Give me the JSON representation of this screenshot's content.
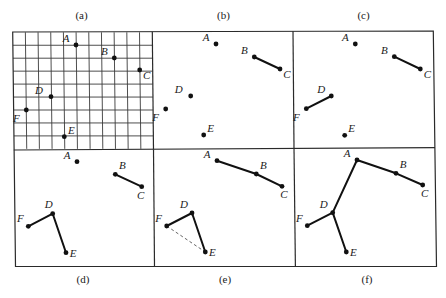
{
  "figure": {
    "description": "Six-panel figure showing step-by-step construction of a minimum spanning tree over points A-F",
    "frame": {
      "outer": [
        [
          12.7,
          32
        ],
        [
          433.3,
          31
        ],
        [
          436.5,
          266.3
        ],
        [
          15.5,
          266.5
        ]
      ],
      "middle_divider": [
        [
          13.8,
          150
        ],
        [
          435,
          147.6
        ]
      ],
      "top_dividers": [
        [
          [
            152.3,
            31.8
          ],
          [
            153.5,
            149.5
          ]
        ],
        [
          [
            293,
            31.2
          ],
          [
            294,
            148
          ]
        ]
      ],
      "bottom_dividers": [
        [
          [
            153.5,
            149.5
          ],
          [
            154.5,
            266.4
          ]
        ],
        [
          [
            294,
            148
          ],
          [
            295.4,
            266.3
          ]
        ]
      ]
    },
    "grid": {
      "panel": "a",
      "x0": 12.7,
      "y0": 32.3,
      "dx": 12.68,
      "dy": 12.95,
      "cols": 11,
      "rows": 9,
      "skew_x_per_y": 0.0115
    },
    "panels": [
      {
        "id": "a",
        "label": "(a)",
        "label_pos": [
          81.5,
          19
        ],
        "points": {
          "A": [
            76,
            45
          ],
          "B": [
            114.3,
            58
          ],
          "C": [
            139.7,
            70
          ],
          "D": [
            51,
            96.7
          ],
          "E": [
            64.3,
            136.7
          ],
          "F": [
            26.3,
            110
          ]
        },
        "label_offsets": {
          "A": [
            -10,
            -3
          ],
          "B": [
            -10,
            -3
          ],
          "C": [
            7,
            9
          ],
          "D": [
            -12,
            -3
          ],
          "E": [
            7,
            -3
          ],
          "F": [
            -10,
            12
          ]
        },
        "edges": [],
        "dashed_edges": []
      },
      {
        "id": "b",
        "label": "(b)",
        "label_pos": [
          223.5,
          19
        ],
        "points": {
          "A": [
            216,
            44
          ],
          "B": [
            254.3,
            57
          ],
          "C": [
            280,
            69
          ],
          "D": [
            190.7,
            96
          ],
          "E": [
            203.7,
            135
          ],
          "F": [
            165.7,
            109
          ]
        },
        "label_offsets": {
          "A": [
            -10,
            -3
          ],
          "B": [
            -10,
            -3
          ],
          "C": [
            7,
            9
          ],
          "D": [
            -12,
            -3
          ],
          "E": [
            7,
            -3
          ],
          "F": [
            -10,
            12
          ]
        },
        "edges": [
          [
            "B",
            "C"
          ]
        ],
        "dashed_edges": []
      },
      {
        "id": "c",
        "label": "(c)",
        "label_pos": [
          363.5,
          19
        ],
        "points": {
          "A": [
            355.3,
            44
          ],
          "B": [
            394.3,
            56.7
          ],
          "C": [
            420.3,
            69
          ],
          "D": [
            331.3,
            96
          ],
          "E": [
            344.7,
            135.3
          ],
          "F": [
            306.3,
            108.7
          ]
        },
        "label_offsets": {
          "A": [
            -10,
            -3
          ],
          "B": [
            -10,
            -3
          ],
          "C": [
            7,
            9
          ],
          "D": [
            -10,
            -3
          ],
          "E": [
            7,
            -3
          ],
          "F": [
            -10,
            12
          ]
        },
        "edges": [
          [
            "B",
            "C"
          ],
          [
            "D",
            "F"
          ]
        ],
        "dashed_edges": []
      },
      {
        "id": "d",
        "label": "(d)",
        "label_pos": [
          83,
          283
        ],
        "points": {
          "A": [
            77,
            161.7
          ],
          "B": [
            115.3,
            174.3
          ],
          "C": [
            141.7,
            186.7
          ],
          "D": [
            52.7,
            213.7
          ],
          "E": [
            66,
            252.7
          ],
          "F": [
            28.3,
            226.3
          ]
        },
        "label_offsets": {
          "A": [
            -10,
            -3
          ],
          "B": [
            7,
            -5
          ],
          "C": [
            -1,
            12
          ],
          "D": [
            -4,
            -6
          ],
          "E": [
            7,
            4
          ],
          "F": [
            -8,
            -4
          ]
        },
        "edges": [
          [
            "B",
            "C"
          ],
          [
            "D",
            "F"
          ],
          [
            "D",
            "E"
          ]
        ],
        "dashed_edges": []
      },
      {
        "id": "e",
        "label": "(e)",
        "label_pos": [
          225,
          283
        ],
        "points": {
          "A": [
            217,
            160.7
          ],
          "B": [
            256.3,
            174
          ],
          "C": [
            282,
            186.3
          ],
          "D": [
            192,
            213
          ],
          "E": [
            205.3,
            252
          ],
          "F": [
            166.7,
            226
          ]
        },
        "label_offsets": {
          "A": [
            -10,
            -3
          ],
          "B": [
            7,
            -5
          ],
          "C": [
            2,
            12
          ],
          "D": [
            -8,
            -5
          ],
          "E": [
            7,
            4
          ],
          "F": [
            -8,
            -4
          ]
        },
        "edges": [
          [
            "A",
            "B"
          ],
          [
            "B",
            "C"
          ],
          [
            "D",
            "F"
          ],
          [
            "D",
            "E"
          ]
        ],
        "dashed_edges": [
          [
            "F",
            "E"
          ]
        ]
      },
      {
        "id": "f",
        "label": "(f)",
        "label_pos": [
          367,
          283
        ],
        "points": {
          "A": [
            357,
            160
          ],
          "B": [
            396,
            173.3
          ],
          "C": [
            422.7,
            185
          ],
          "D": [
            332.7,
            212.7
          ],
          "E": [
            346.3,
            252
          ],
          "F": [
            307.3,
            225.7
          ]
        },
        "label_offsets": {
          "A": [
            -10,
            -3
          ],
          "B": [
            7,
            -5
          ],
          "C": [
            2,
            12
          ],
          "D": [
            -9,
            -5
          ],
          "E": [
            7,
            4
          ],
          "F": [
            -8,
            -4
          ]
        },
        "edges": [
          [
            "A",
            "B"
          ],
          [
            "B",
            "C"
          ],
          [
            "A",
            "D"
          ],
          [
            "D",
            "F"
          ],
          [
            "D",
            "E"
          ]
        ],
        "dashed_edges": []
      }
    ]
  },
  "colors": {
    "background": "#ffffff",
    "ink": "#111111",
    "frame": "#2a2a2a",
    "dashed": "#555555"
  }
}
